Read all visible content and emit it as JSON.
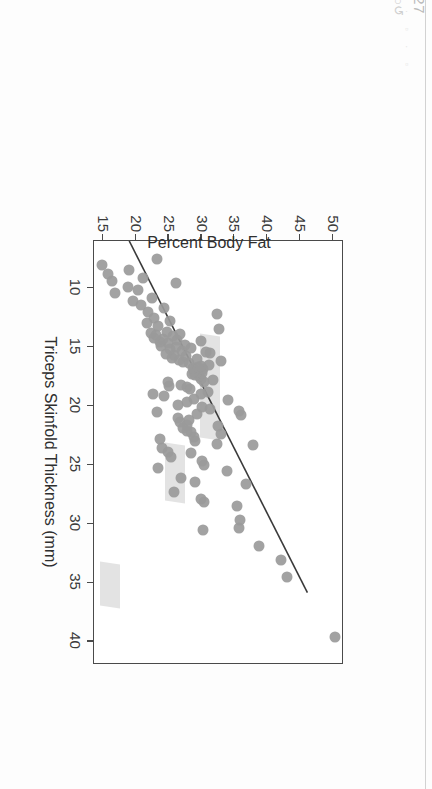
{
  "viewer": {
    "page_indicator": "5/27",
    "refresh_icon": "↻○↺",
    "toolbar_ghost": "▫ · ▫ · ▫ · ▫ · ▫"
  },
  "chart_data": {
    "type": "scatter",
    "title": "",
    "xlabel": "Triceps Skinfold Thickness (mm)",
    "ylabel": "Percent Body Fat",
    "xlim": [
      6,
      42
    ],
    "ylim": [
      13.5,
      51.5
    ],
    "xticks": [
      10,
      15,
      20,
      25,
      30,
      35,
      40
    ],
    "xticklabels": [
      "10",
      "15",
      "20",
      "25",
      "30",
      "35",
      "40"
    ],
    "yticks": [
      15,
      20,
      25,
      30,
      35,
      40,
      45,
      50
    ],
    "yticklabels": [
      "15",
      "20",
      "25",
      "30",
      "35",
      "40",
      "45",
      "50"
    ],
    "grid": false,
    "legend": null,
    "marker_color": "#9a9a9a",
    "line_color": "#3a3a3a",
    "band_color": "#d8d8d8",
    "fit_line": {
      "label": "least-squares fit",
      "x0": 6.0,
      "y0": 18.9,
      "x1": 36.0,
      "y1": 46.2
    },
    "highlight_bands": [
      {
        "x0": 14.0,
        "x1": 22.8,
        "y0": 29.8,
        "y1": 32.9
      },
      {
        "x0": 23.2,
        "x1": 28.1,
        "y0": 24.6,
        "y1": 27.6
      },
      {
        "x0": 33.3,
        "x1": 37.0,
        "y0": 14.6,
        "y1": 17.7
      }
    ],
    "points": [
      [
        39.6,
        50.4
      ],
      [
        34.5,
        43.2
      ],
      [
        33.1,
        42.3
      ],
      [
        31.9,
        38.9
      ],
      [
        30.4,
        35.8
      ],
      [
        30.5,
        30.4
      ],
      [
        29.7,
        36.0
      ],
      [
        28.5,
        35.5
      ],
      [
        28.2,
        30.5
      ],
      [
        27.9,
        30.0
      ],
      [
        26.6,
        36.9
      ],
      [
        26.5,
        29.2
      ],
      [
        26.1,
        27.1
      ],
      [
        25.5,
        34.0
      ],
      [
        25.0,
        30.6
      ],
      [
        24.7,
        30.2
      ],
      [
        24.3,
        25.5
      ],
      [
        24.0,
        28.6
      ],
      [
        23.9,
        25.0
      ],
      [
        23.3,
        38.0
      ],
      [
        23.2,
        32.5
      ],
      [
        23.0,
        29.2
      ],
      [
        22.6,
        29.0
      ],
      [
        22.4,
        33.1
      ],
      [
        22.2,
        28.6
      ],
      [
        22.1,
        27.9
      ],
      [
        21.9,
        27.3
      ],
      [
        21.7,
        32.7
      ],
      [
        21.6,
        28.0
      ],
      [
        21.4,
        26.9
      ],
      [
        21.2,
        28.3
      ],
      [
        21.0,
        26.5
      ],
      [
        20.8,
        36.2
      ],
      [
        20.7,
        29.5
      ],
      [
        20.4,
        35.8
      ],
      [
        20.3,
        31.4
      ],
      [
        20.1,
        30.2
      ],
      [
        19.9,
        26.6
      ],
      [
        19.7,
        28.0
      ],
      [
        19.5,
        34.1
      ],
      [
        19.4,
        29.0
      ],
      [
        19.2,
        24.5
      ],
      [
        19.0,
        30.0
      ],
      [
        18.8,
        31.2
      ],
      [
        18.6,
        28.4
      ],
      [
        18.4,
        28.0
      ],
      [
        18.3,
        25.2
      ],
      [
        18.2,
        27.1
      ],
      [
        18.0,
        30.6
      ],
      [
        18.0,
        25.0
      ],
      [
        17.8,
        31.9
      ],
      [
        17.7,
        30.0
      ],
      [
        17.5,
        29.8
      ],
      [
        17.4,
        29.1
      ],
      [
        17.3,
        28.7
      ],
      [
        17.2,
        30.2
      ],
      [
        17.1,
        29.4
      ],
      [
        17.0,
        29.0
      ],
      [
        16.9,
        30.3
      ],
      [
        16.8,
        28.9
      ],
      [
        16.7,
        29.6
      ],
      [
        16.6,
        30.0
      ],
      [
        16.5,
        31.3
      ],
      [
        16.4,
        28.2
      ],
      [
        16.3,
        27.4
      ],
      [
        16.2,
        33.1
      ],
      [
        16.1,
        26.8
      ],
      [
        16.0,
        29.5
      ],
      [
        15.9,
        25.6
      ],
      [
        15.8,
        27.8
      ],
      [
        15.7,
        26.0
      ],
      [
        15.6,
        24.8
      ],
      [
        15.5,
        31.5
      ],
      [
        15.4,
        30.9
      ],
      [
        15.3,
        27.2
      ],
      [
        15.2,
        25.4
      ],
      [
        15.1,
        28.6
      ],
      [
        15.0,
        26.2
      ],
      [
        14.9,
        24.0
      ],
      [
        14.8,
        27.6
      ],
      [
        14.7,
        25.1
      ],
      [
        14.6,
        23.8
      ],
      [
        14.5,
        30.1
      ],
      [
        14.4,
        26.4
      ],
      [
        14.3,
        24.3
      ],
      [
        14.2,
        22.9
      ],
      [
        14.1,
        25.8
      ],
      [
        14.0,
        23.2
      ],
      [
        13.9,
        26.9
      ],
      [
        13.8,
        22.5
      ],
      [
        13.7,
        24.9
      ],
      [
        13.5,
        32.8
      ],
      [
        13.2,
        23.6
      ],
      [
        13.0,
        21.9
      ],
      [
        12.8,
        25.3
      ],
      [
        12.5,
        23.0
      ],
      [
        12.2,
        32.5
      ],
      [
        12.0,
        22.0
      ],
      [
        11.7,
        24.4
      ],
      [
        11.4,
        21.0
      ],
      [
        11.1,
        19.8
      ],
      [
        10.8,
        22.6
      ],
      [
        10.4,
        17.0
      ],
      [
        10.2,
        20.5
      ],
      [
        9.9,
        18.9
      ],
      [
        9.6,
        26.3
      ],
      [
        9.4,
        16.5
      ],
      [
        9.1,
        21.3
      ],
      [
        8.8,
        15.9
      ],
      [
        8.5,
        19.2
      ],
      [
        8.0,
        15.0
      ],
      [
        7.5,
        23.4
      ],
      [
        25.3,
        23.5
      ],
      [
        23.6,
        24.2
      ],
      [
        22.8,
        23.9
      ],
      [
        27.3,
        26.0
      ],
      [
        19.0,
        22.8
      ],
      [
        20.5,
        23.4
      ]
    ]
  }
}
